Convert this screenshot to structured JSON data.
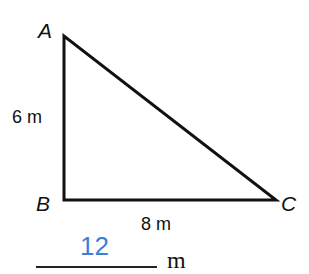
{
  "figure": {
    "type": "right-triangle",
    "vertices": {
      "A": {
        "label": "A",
        "x": 64,
        "y": 36
      },
      "B": {
        "label": "B",
        "x": 64,
        "y": 200
      },
      "C": {
        "label": "C",
        "x": 276,
        "y": 200
      }
    },
    "sides": {
      "AB": {
        "label": "6 m"
      },
      "BC": {
        "label": "8 m"
      }
    },
    "stroke_color": "#111111"
  },
  "answer": {
    "value": "12",
    "unit": "m",
    "color": "#3d7fd4"
  }
}
